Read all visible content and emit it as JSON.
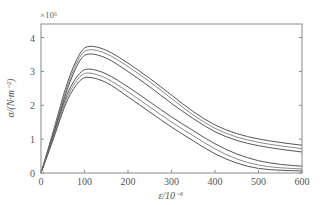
{
  "chart_data": {
    "type": "line",
    "title": "",
    "xlabel": "ε/10⁻⁶",
    "ylabel": "σ/(N·m⁻²)",
    "y_scale_label": "×10⁶",
    "xlim": [
      0,
      600
    ],
    "ylim": [
      0,
      4.4
    ],
    "x_ticks": [
      0,
      100,
      200,
      300,
      400,
      500,
      600
    ],
    "y_ticks": [
      0,
      1,
      2,
      3,
      4
    ],
    "grid": false,
    "legend": null,
    "series": [
      {
        "name": "curve-1",
        "x": [
          0,
          30,
          60,
          90,
          110,
          150,
          200,
          250,
          300,
          350,
          400,
          450,
          500,
          550,
          600
        ],
        "y": [
          0,
          1.3,
          2.7,
          3.6,
          3.78,
          3.65,
          3.25,
          2.8,
          2.3,
          1.8,
          1.4,
          1.15,
          1.0,
          0.9,
          0.82
        ]
      },
      {
        "name": "curve-2",
        "x": [
          0,
          30,
          60,
          90,
          110,
          150,
          200,
          250,
          300,
          350,
          400,
          450,
          500,
          550,
          600
        ],
        "y": [
          0,
          1.25,
          2.6,
          3.5,
          3.68,
          3.55,
          3.15,
          2.7,
          2.2,
          1.7,
          1.3,
          1.05,
          0.9,
          0.8,
          0.72
        ]
      },
      {
        "name": "curve-3",
        "x": [
          0,
          30,
          60,
          90,
          110,
          150,
          200,
          250,
          300,
          350,
          400,
          450,
          500,
          550,
          600
        ],
        "y": [
          0,
          1.2,
          2.5,
          3.4,
          3.55,
          3.42,
          3.0,
          2.55,
          2.05,
          1.6,
          1.2,
          0.95,
          0.8,
          0.7,
          0.62
        ]
      },
      {
        "name": "curve-4",
        "x": [
          0,
          30,
          60,
          90,
          110,
          150,
          200,
          250,
          300,
          350,
          400,
          450,
          500,
          550,
          600
        ],
        "y": [
          0,
          1.15,
          2.4,
          3.0,
          3.1,
          2.95,
          2.55,
          2.1,
          1.65,
          1.25,
          0.85,
          0.55,
          0.35,
          0.25,
          0.2
        ]
      },
      {
        "name": "curve-5",
        "x": [
          0,
          30,
          60,
          90,
          110,
          150,
          200,
          250,
          300,
          350,
          400,
          450,
          500,
          550,
          600
        ],
        "y": [
          0,
          1.1,
          2.3,
          2.9,
          2.98,
          2.82,
          2.4,
          1.95,
          1.5,
          1.1,
          0.7,
          0.4,
          0.22,
          0.15,
          0.12
        ]
      },
      {
        "name": "curve-6",
        "x": [
          0,
          30,
          60,
          90,
          110,
          150,
          200,
          250,
          300,
          350,
          400,
          450,
          500,
          550,
          600
        ],
        "y": [
          0,
          1.05,
          2.2,
          2.78,
          2.85,
          2.7,
          2.25,
          1.8,
          1.35,
          0.95,
          0.55,
          0.28,
          0.12,
          0.08,
          0.06
        ]
      }
    ]
  }
}
